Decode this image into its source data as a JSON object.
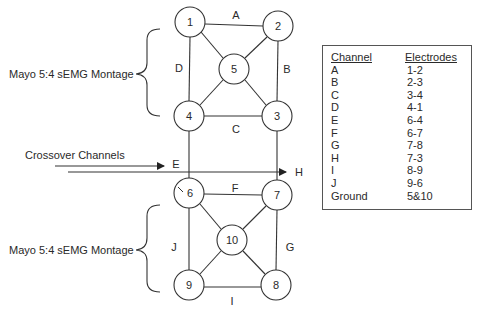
{
  "diagram": {
    "montage_labels": {
      "top": "Mayo 5:4 sEMG Montage",
      "bottom": "Mayo 5:4 sEMG Montage"
    },
    "crossover_label": "Crossover Channels",
    "nodes": [
      {
        "id": "1",
        "x": 190,
        "y": 22
      },
      {
        "id": "2",
        "x": 278,
        "y": 26
      },
      {
        "id": "5",
        "x": 234,
        "y": 69
      },
      {
        "id": "4",
        "x": 189,
        "y": 116
      },
      {
        "id": "3",
        "x": 277,
        "y": 116
      },
      {
        "id": "6",
        "x": 189,
        "y": 193
      },
      {
        "id": "7",
        "x": 277,
        "y": 195
      },
      {
        "id": "10",
        "x": 232,
        "y": 240
      },
      {
        "id": "9",
        "x": 189,
        "y": 285
      },
      {
        "id": "8",
        "x": 276,
        "y": 285
      }
    ],
    "channel_labels": {
      "A": "A",
      "B": "B",
      "C": "C",
      "D": "D",
      "E": "E",
      "F": "F",
      "G": "G",
      "H": "H",
      "I": "I",
      "J": "J"
    }
  },
  "table": {
    "headers": {
      "channel": "Channel",
      "electrodes": "Electrodes"
    },
    "rows": [
      {
        "channel": "A",
        "electrodes": "1-2"
      },
      {
        "channel": "B",
        "electrodes": "2-3"
      },
      {
        "channel": "C",
        "electrodes": "3-4"
      },
      {
        "channel": "D",
        "electrodes": "4-1"
      },
      {
        "channel": "E",
        "electrodes": "6-4"
      },
      {
        "channel": "F",
        "electrodes": "6-7"
      },
      {
        "channel": "G",
        "electrodes": "7-8"
      },
      {
        "channel": "H",
        "electrodes": "7-3"
      },
      {
        "channel": "I",
        "electrodes": "8-9"
      },
      {
        "channel": "J",
        "electrodes": "9-6"
      },
      {
        "channel": "Ground",
        "electrodes": "5&10"
      }
    ]
  }
}
